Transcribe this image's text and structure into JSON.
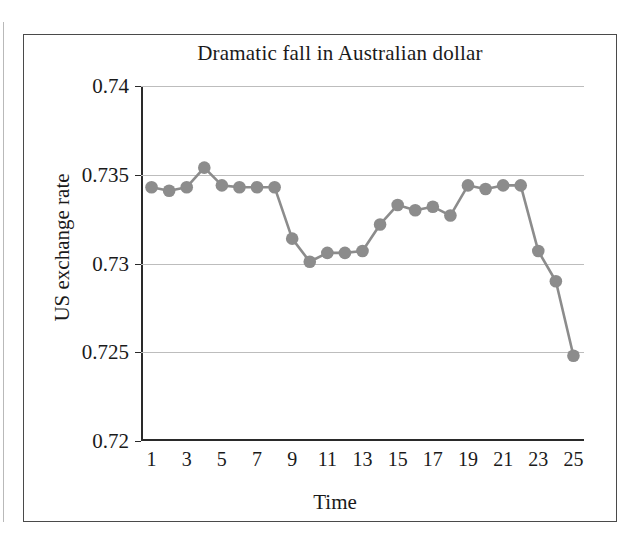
{
  "figure": {
    "title": "Dramatic fall in Australian dollar",
    "x_axis_title": "Time",
    "y_axis_title": "US exchange rate"
  },
  "style": {
    "series_color": "#8c8c8c",
    "axis_color": "#2a2a2a",
    "grid_color": "#bdbdbd",
    "frame_color": "#4a4a4a",
    "text_color": "#1a1a1a",
    "background": "#ffffff"
  },
  "chart_data": {
    "type": "line",
    "title": "Dramatic fall in Australian dollar",
    "xlabel": "Time",
    "ylabel": "US exchange rate",
    "xlim": [
      0.4,
      25.6
    ],
    "ylim": [
      0.72,
      0.74
    ],
    "grid": true,
    "legend": null,
    "markers": "filled-circle",
    "y_ticks": [
      0.72,
      0.725,
      0.73,
      0.735,
      0.74
    ],
    "y_tick_labels": [
      "0.72",
      "0.725",
      "0.73",
      "0.735",
      "0.74"
    ],
    "x_ticks": [
      1,
      3,
      5,
      7,
      9,
      11,
      13,
      15,
      17,
      19,
      21,
      23,
      25
    ],
    "x_tick_labels": [
      "1",
      "3",
      "5",
      "7",
      "9",
      "11",
      "13",
      "15",
      "17",
      "19",
      "21",
      "23",
      "25"
    ],
    "x": [
      1,
      2,
      3,
      4,
      5,
      6,
      7,
      8,
      9,
      10,
      11,
      12,
      13,
      14,
      15,
      16,
      17,
      18,
      19,
      20,
      21,
      22,
      23,
      24,
      25
    ],
    "values": [
      0.7343,
      0.7341,
      0.7343,
      0.7354,
      0.7344,
      0.7343,
      0.7343,
      0.7343,
      0.7314,
      0.7301,
      0.7306,
      0.7306,
      0.7307,
      0.7322,
      0.7333,
      0.733,
      0.7332,
      0.7327,
      0.7344,
      0.7342,
      0.7344,
      0.7344,
      0.7307,
      0.729,
      0.7248
    ]
  }
}
